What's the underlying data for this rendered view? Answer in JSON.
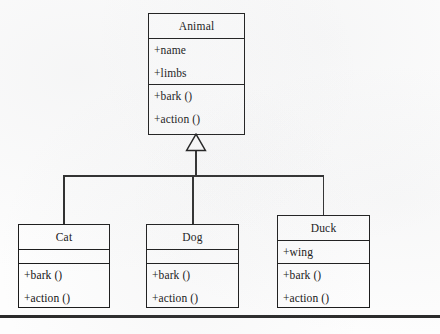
{
  "diagram": {
    "type": "uml-class-diagram",
    "relationship": "generalization",
    "visibility_prefix": "+",
    "colors": {
      "background": "#fdfdfd",
      "stroke": "#1a1a1a",
      "edge": "#2b2b2b",
      "text": "#121212",
      "box_fill": "#fefefe"
    },
    "classes": [
      {
        "id": "animal",
        "name": "Animal",
        "attributes": [
          "+name",
          "+limbs"
        ],
        "operations": [
          "+bark ()",
          "+action ()"
        ],
        "role": "superclass"
      },
      {
        "id": "cat",
        "name": "Cat",
        "attributes": [],
        "operations": [
          "+bark ()",
          "+action ()"
        ],
        "role": "subclass"
      },
      {
        "id": "dog",
        "name": "Dog",
        "attributes": [],
        "operations": [
          "+bark ()",
          "+action ()"
        ],
        "role": "subclass"
      },
      {
        "id": "duck",
        "name": "Duck",
        "attributes": [
          "+wing"
        ],
        "operations": [
          "+bark ()",
          "+action ()"
        ],
        "role": "subclass"
      }
    ],
    "generalizations": [
      {
        "from": "Cat",
        "to": "Animal"
      },
      {
        "from": "Dog",
        "to": "Animal"
      },
      {
        "from": "Duck",
        "to": "Animal"
      }
    ]
  }
}
